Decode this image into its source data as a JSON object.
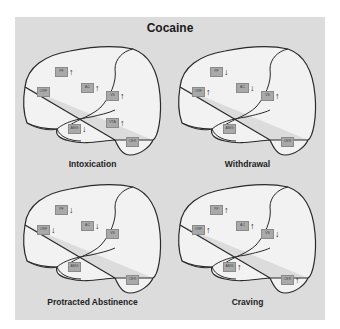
{
  "title": "Cocaine",
  "colors": {
    "panel": "#dcdcdc",
    "outline": "#2a2a2a",
    "label_box": "#a9a9a9"
  },
  "regions_legend": [
    "PF",
    "ORF",
    "AC",
    "VS",
    "AMG",
    "VTA",
    "CER"
  ],
  "panels": [
    {
      "caption": "Intoxication",
      "regions": {
        "PF": {
          "label": "PF",
          "arrow": "↑"
        },
        "ORF": {
          "label": "ORF",
          "arrow": ""
        },
        "AC": {
          "label": "AC",
          "arrow": "↑"
        },
        "VS": {
          "label": "VS",
          "arrow": "↑"
        },
        "AMG": {
          "label": "AMG",
          "arrow": "↓"
        },
        "VTA": {
          "label": "VTA",
          "arrow": "↑"
        },
        "CER": {
          "label": "CER",
          "arrow": ""
        }
      }
    },
    {
      "caption": "Withdrawal",
      "regions": {
        "PF": {
          "label": "PF",
          "arrow": "↓"
        },
        "ORF": {
          "label": "ORF",
          "arrow": "↑"
        },
        "AC": {
          "label": "AC",
          "arrow": "↓"
        },
        "VS": {
          "label": "VS",
          "arrow": "↑"
        },
        "AMG": {
          "label": "AMG",
          "arrow": ""
        },
        "CER": {
          "label": "CER",
          "arrow": ""
        }
      }
    },
    {
      "caption": "Protracted Abstinence",
      "regions": {
        "PF": {
          "label": "PF",
          "arrow": "↓"
        },
        "ORF": {
          "label": "ORF",
          "arrow": "↓"
        },
        "AC": {
          "label": "AC",
          "arrow": "↓"
        },
        "VS": {
          "label": "VS",
          "arrow": ""
        },
        "AMG": {
          "label": "AMG",
          "arrow": ""
        },
        "CER": {
          "label": "CER",
          "arrow": ""
        }
      }
    },
    {
      "caption": "Craving",
      "regions": {
        "PF": {
          "label": "PF",
          "arrow": "↑"
        },
        "ORF": {
          "label": "ORF",
          "arrow": "↑"
        },
        "AC": {
          "label": "AC",
          "arrow": "↑"
        },
        "VS": {
          "label": "VS",
          "arrow": "↓"
        },
        "AMG": {
          "label": "AMG",
          "arrow": "↑"
        },
        "CER": {
          "label": "CER",
          "arrow": "↑"
        }
      }
    }
  ]
}
